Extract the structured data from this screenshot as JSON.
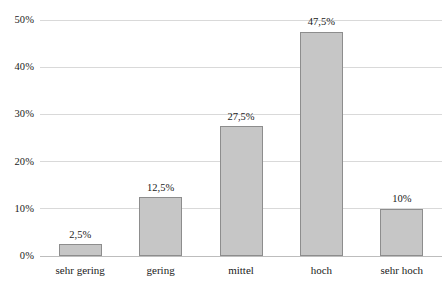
{
  "chart_data": {
    "type": "bar",
    "title": "",
    "subtitle": "",
    "xlabel": "",
    "ylabel": "",
    "categories": [
      "sehr gering",
      "gering",
      "mittel",
      "hoch",
      "sehr hoch"
    ],
    "values": [
      2.5,
      12.5,
      27.5,
      47.5,
      10
    ],
    "value_labels": [
      "2,5%",
      "12,5%",
      "27,5%",
      "47,5%",
      "10%"
    ],
    "ylim": [
      0,
      50
    ],
    "yticks": [
      0,
      10,
      20,
      30,
      40,
      50
    ],
    "ytick_labels": [
      "0%",
      "10%",
      "20%",
      "30%",
      "40%",
      "50%"
    ],
    "grid": true,
    "legend": "none",
    "series": [
      {
        "name": "",
        "values": [
          2.5,
          12.5,
          27.5,
          47.5,
          10
        ]
      }
    ],
    "colors": {
      "bar_fill": "#c6c6c6",
      "bar_border": "#8d8d8d",
      "gridline": "#d9d9d9",
      "axis": "#bdbdbd",
      "text": "#1a1a1a",
      "background": "#ffffff"
    }
  }
}
